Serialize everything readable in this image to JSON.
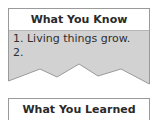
{
  "what_you_know": {
    "title": "What You Know",
    "items": [
      "1. Living things grow.",
      "2."
    ]
  },
  "what_you_learned": {
    "title": "What You Learned"
  },
  "colors": {
    "box_fill": "#d2d2d2",
    "border": "#9a9a9a",
    "header_fill": "#ffffff"
  }
}
